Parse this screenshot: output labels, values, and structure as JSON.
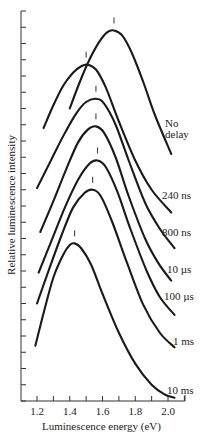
{
  "chart_data": {
    "type": "line",
    "title": "",
    "xlabel": "Luminescence energy (eV)",
    "ylabel": "Relative luminescence intensity",
    "xlim": [
      1.1,
      2.1
    ],
    "ylim": [
      0,
      24
    ],
    "x_ticks": [
      1.2,
      1.4,
      1.6,
      1.8,
      2.0
    ],
    "x_tick_labels": [
      "1.2",
      "1.4",
      "1.6",
      "1.8",
      "2.0"
    ],
    "x_minor_ticks": [
      1.3,
      1.5,
      1.7,
      1.9,
      2.1
    ],
    "y_ticks_count": 24,
    "y_tick_labels": [],
    "grid": false,
    "legend": "inline labels at right end of each curve",
    "annotations": "Short vertical bar marks peak position above each curve",
    "series": [
      {
        "name": "No delay",
        "peak_eV": 1.67,
        "label_lines": [
          "No",
          "delay"
        ],
        "label_pos": [
          165,
          118
        ],
        "x": [
          1.4,
          1.46,
          1.52,
          1.58,
          1.63,
          1.67,
          1.72,
          1.78,
          1.85,
          1.92,
          2.02
        ],
        "y": [
          18.0,
          19.6,
          21.0,
          22.1,
          22.7,
          22.8,
          22.5,
          21.4,
          19.6,
          17.6,
          15.2
        ]
      },
      {
        "name": "240 ns",
        "peak_eV": 1.5,
        "label_lines": [
          "240 ns"
        ],
        "label_pos": [
          162,
          190
        ],
        "x": [
          1.24,
          1.3,
          1.36,
          1.42,
          1.47,
          1.51,
          1.56,
          1.62,
          1.7,
          1.8,
          1.9,
          2.02
        ],
        "y": [
          16.8,
          18.2,
          19.4,
          20.2,
          20.6,
          20.7,
          20.4,
          19.3,
          17.2,
          14.8,
          13.0,
          11.6
        ]
      },
      {
        "name": "800 ns",
        "peak_eV": 1.56,
        "label_lines": [
          "800 ns"
        ],
        "label_pos": [
          162,
          227
        ],
        "x": [
          1.2,
          1.28,
          1.36,
          1.44,
          1.5,
          1.56,
          1.61,
          1.68,
          1.76,
          1.86,
          1.95,
          2.04
        ],
        "y": [
          13.1,
          14.7,
          16.3,
          17.7,
          18.4,
          18.6,
          18.3,
          17.0,
          14.8,
          12.2,
          10.6,
          9.4
        ]
      },
      {
        "name": "10 µs",
        "peak_eV": 1.56,
        "label_lines": [
          "10 µs"
        ],
        "label_pos": [
          167,
          264
        ],
        "x": [
          1.22,
          1.3,
          1.38,
          1.45,
          1.51,
          1.56,
          1.61,
          1.68,
          1.76,
          1.86,
          1.94,
          2.02
        ],
        "y": [
          10.4,
          12.3,
          14.3,
          15.9,
          16.7,
          16.9,
          16.5,
          15.0,
          12.6,
          10.0,
          8.5,
          7.4
        ]
      },
      {
        "name": "100 µs",
        "peak_eV": 1.57,
        "label_lines": [
          "100 µs"
        ],
        "label_pos": [
          164,
          291
        ],
        "x": [
          1.21,
          1.29,
          1.37,
          1.45,
          1.52,
          1.57,
          1.62,
          1.69,
          1.77,
          1.87,
          1.95,
          2.04
        ],
        "y": [
          7.9,
          9.9,
          11.9,
          13.6,
          14.6,
          14.8,
          14.4,
          12.9,
          10.6,
          8.0,
          6.4,
          5.3
        ]
      },
      {
        "name": "1 ms",
        "peak_eV": 1.54,
        "label_lines": [
          "1 ms"
        ],
        "label_pos": [
          173,
          336
        ],
        "x": [
          1.2,
          1.27,
          1.35,
          1.42,
          1.49,
          1.54,
          1.59,
          1.66,
          1.75,
          1.85,
          1.95,
          2.04
        ],
        "y": [
          6.0,
          8.0,
          10.2,
          11.9,
          12.8,
          13.0,
          12.6,
          11.0,
          8.5,
          5.9,
          4.2,
          3.3
        ]
      },
      {
        "name": "10 ms",
        "peak_eV": 1.43,
        "label_lines": [
          "10 ms"
        ],
        "label_pos": [
          167,
          385
        ],
        "x": [
          1.19,
          1.24,
          1.3,
          1.36,
          1.4,
          1.43,
          1.47,
          1.53,
          1.6,
          1.7,
          1.8,
          1.9,
          1.98,
          2.04
        ],
        "y": [
          3.4,
          5.4,
          7.6,
          9.0,
          9.6,
          9.7,
          9.4,
          8.4,
          6.6,
          4.2,
          2.3,
          1.0,
          0.4,
          0.2
        ]
      }
    ]
  }
}
